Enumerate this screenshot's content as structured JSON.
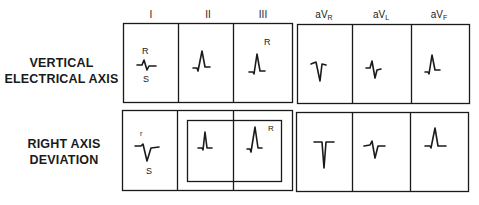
{
  "lead_headers": {
    "I": "I",
    "II": "II",
    "III": "III",
    "aVR": {
      "base": "aV",
      "sub": "R"
    },
    "aVL": {
      "base": "aV",
      "sub": "L"
    },
    "aVF": {
      "base": "aV",
      "sub": "F"
    }
  },
  "rows": [
    {
      "label_line1": "VERTICAL",
      "label_line2": "ELECTRICAL AXIS",
      "annotations": {
        "lead_I_top": "R",
        "lead_I_bottom": "S",
        "lead_III_top": "R"
      }
    },
    {
      "label_line1": "RIGHT AXIS",
      "label_line2": "DEVIATION",
      "annotations": {
        "lead_I_top": "r",
        "lead_I_bottom": "S",
        "lead_III_top": "R"
      }
    }
  ],
  "colors": {
    "line": "#1a1a1a",
    "background": "#ffffff"
  }
}
